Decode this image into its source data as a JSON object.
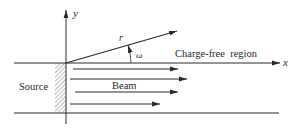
{
  "diagram": {
    "labels": {
      "y_axis": "y",
      "x_axis": "x",
      "r": "r",
      "omega": "ω",
      "charge_free_region": "Charge-free  region",
      "beam": "Beam",
      "source": "Source"
    },
    "colors": {
      "line": "#2a2a2a",
      "background": "#ffffff"
    }
  }
}
